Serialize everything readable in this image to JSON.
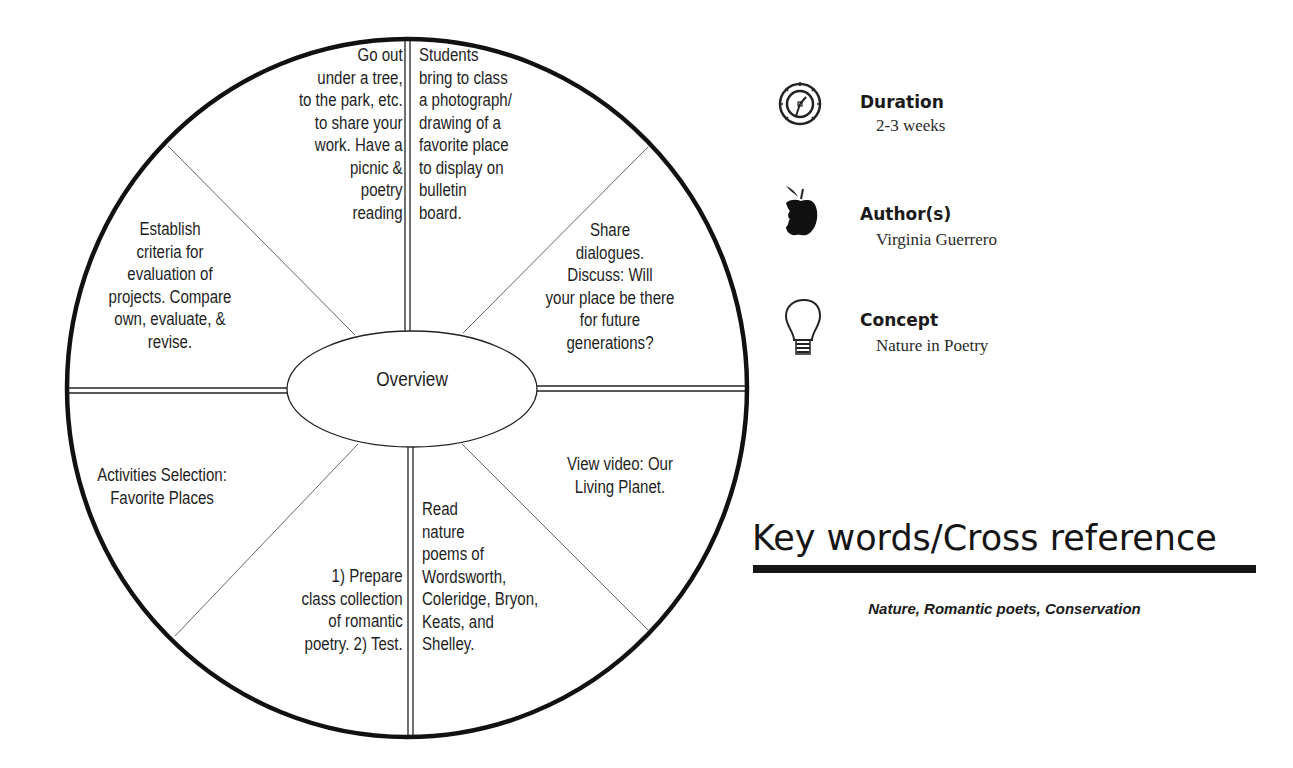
{
  "wheel": {
    "center_label": "Overview",
    "segments": [
      {
        "position": "top-left-inner",
        "text": "Go out\nunder a tree,\nto the park, etc.\nto share your\nwork.  Have a\npicnic &\npoetry\nreading"
      },
      {
        "position": "top-right-inner",
        "text": "Students\nbring to class\na photograph/\ndrawing of a\nfavorite place\nto display on\nbulletin\nboard."
      },
      {
        "position": "right-upper",
        "text": "Share\ndialogues.\nDiscuss: Will\nyour place be there\nfor future\ngenerations?"
      },
      {
        "position": "right-lower",
        "text": "View video:  Our\nLiving Planet."
      },
      {
        "position": "bottom-right-inner",
        "text": "Read\nnature\npoems of\nWordsworth,\nColeridge, Bryon,\nKeats, and\nShelley."
      },
      {
        "position": "bottom-left-inner",
        "text": "1) Prepare\nclass collection\nof romantic\npoetry.  2) Test."
      },
      {
        "position": "left-lower",
        "text": "Activities Selection:\nFavorite Places"
      },
      {
        "position": "left-upper",
        "text": "Establish\ncriteria for\nevaluation of\nprojects.  Compare\nown, evaluate, &\nrevise."
      }
    ]
  },
  "info": {
    "duration": {
      "icon": "clock-icon",
      "label": "Duration",
      "value": "2-3 weeks"
    },
    "author": {
      "icon": "apple-icon",
      "label": "Author(s)",
      "value": "Virginia Guerrero"
    },
    "concept": {
      "icon": "lightbulb-icon",
      "label": "Concept",
      "value": "Nature in Poetry"
    }
  },
  "keywords": {
    "title": "Key words/Cross reference",
    "list": "Nature, Romantic poets, Conservation"
  },
  "colors": {
    "ink": "#1a1a1a",
    "background": "#ffffff"
  }
}
